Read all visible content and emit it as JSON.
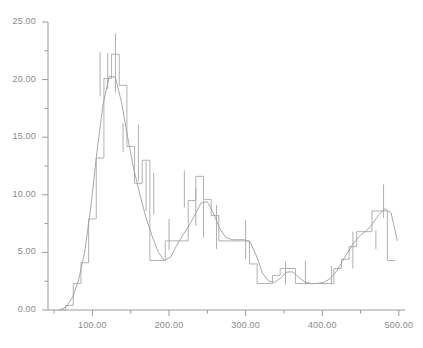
{
  "chart_data": {
    "type": "line",
    "title": "",
    "subtitle": "",
    "xlabel": "",
    "ylabel": "",
    "xlim": [
      42,
      508
    ],
    "ylim": [
      0,
      25
    ],
    "grid": false,
    "legend": null,
    "annotations": [],
    "x_ticks_major": [
      100,
      200,
      300,
      400,
      500
    ],
    "x_tick_labels": [
      "100.00",
      "200.00",
      "300.00",
      "400.00",
      "500.00"
    ],
    "x_ticks_minor": [
      50,
      150,
      250,
      350,
      450
    ],
    "y_ticks_major": [
      0,
      5,
      10,
      15,
      20,
      25
    ],
    "y_tick_labels": [
      "0.00",
      "5.00",
      "10.00",
      "15.00",
      "20.00",
      "25.00"
    ],
    "y_ticks_minor": [
      2.5,
      7.5,
      12.5,
      17.5,
      22.5
    ],
    "colors": {
      "step_line": "#a9a9a9",
      "smooth_line": "#9e9e9e",
      "error_bar": "#9a9a9a",
      "axis": "#9a9a9a",
      "tick_text": "#8a8a8a",
      "background": "#ffffff"
    },
    "series": [
      {
        "name": "binned-counts-step",
        "style": "step",
        "bin_edges": [
          55,
          65,
          75,
          85,
          95,
          105,
          115,
          125,
          135,
          145,
          155,
          165,
          175,
          185,
          195,
          205,
          215,
          225,
          235,
          245,
          255,
          265,
          275,
          285,
          295,
          305,
          315,
          325,
          335,
          345,
          355,
          365,
          375,
          385,
          395,
          405,
          415,
          425,
          435,
          445,
          455,
          465,
          475,
          485,
          495
        ],
        "bin_values": [
          0.0,
          0.4,
          2.3,
          4.1,
          7.9,
          13.2,
          20.1,
          22.2,
          19.5,
          14.2,
          11.0,
          13.0,
          4.3,
          4.3,
          6.0,
          6.0,
          6.0,
          9.5,
          11.6,
          9.6,
          8.2,
          6.0,
          6.0,
          6.0,
          6.0,
          4.0,
          2.3,
          2.3,
          3.0,
          3.6,
          3.6,
          2.3,
          2.3,
          2.3,
          2.3,
          2.3,
          3.6,
          4.4,
          5.5,
          6.8,
          6.8,
          8.6,
          8.6,
          4.3
        ]
      },
      {
        "name": "smooth-fit-curve",
        "style": "line",
        "x": [
          58,
          66,
          74,
          82,
          90,
          98,
          106,
          114,
          122,
          130,
          138,
          146,
          154,
          162,
          170,
          178,
          186,
          194,
          202,
          210,
          218,
          226,
          234,
          242,
          250,
          258,
          266,
          274,
          282,
          290,
          298,
          306,
          314,
          322,
          330,
          338,
          346,
          354,
          362,
          370,
          378,
          386,
          394,
          402,
          410,
          418,
          426,
          434,
          442,
          450,
          458,
          466,
          474,
          482,
          490,
          498
        ],
        "y": [
          0.0,
          0.3,
          1.1,
          2.6,
          5.1,
          9.0,
          13.8,
          17.9,
          20.3,
          20.2,
          18.0,
          15.0,
          12.2,
          10.0,
          8.0,
          6.4,
          5.0,
          4.3,
          4.6,
          5.6,
          6.5,
          7.3,
          8.3,
          9.3,
          9.4,
          8.4,
          7.1,
          6.3,
          6.1,
          6.1,
          6.1,
          5.9,
          4.7,
          3.2,
          2.5,
          2.4,
          2.8,
          3.3,
          3.3,
          2.8,
          2.4,
          2.3,
          2.3,
          2.4,
          2.7,
          3.3,
          4.2,
          5.1,
          5.9,
          6.5,
          6.9,
          7.5,
          8.3,
          8.8,
          8.4,
          6.0
        ]
      }
    ],
    "error_bars": [
      {
        "x": 110,
        "value": 20.1,
        "low": 18.6,
        "high": 22.4
      },
      {
        "x": 120,
        "value": 22.2,
        "low": 19.2,
        "high": 22.3
      },
      {
        "x": 130,
        "value": 19.5,
        "low": 18.9,
        "high": 24.0
      },
      {
        "x": 140,
        "value": 14.2,
        "low": 13.7,
        "high": 16.2
      },
      {
        "x": 160,
        "value": 13.0,
        "low": 11.2,
        "high": 16.1
      },
      {
        "x": 170,
        "value": 4.3,
        "low": 8.6,
        "high": 12.9
      },
      {
        "x": 180,
        "value": 4.3,
        "low": 8.3,
        "high": 11.9
      },
      {
        "x": 200,
        "value": 6.0,
        "low": 5.2,
        "high": 7.9
      },
      {
        "x": 220,
        "value": 9.5,
        "low": 8.9,
        "high": 12.1
      },
      {
        "x": 235,
        "value": 11.6,
        "low": 7.3,
        "high": 10.6
      },
      {
        "x": 245,
        "value": 9.6,
        "low": 6.3,
        "high": 9.5
      },
      {
        "x": 262,
        "value": 6.0,
        "low": 5.3,
        "high": 9.1
      },
      {
        "x": 300,
        "value": 6.0,
        "low": 4.4,
        "high": 7.8
      },
      {
        "x": 352,
        "value": 3.0,
        "low": 2.2,
        "high": 4.2
      },
      {
        "x": 378,
        "value": 2.3,
        "low": 2.2,
        "high": 4.3
      },
      {
        "x": 412,
        "value": 2.3,
        "low": 2.2,
        "high": 3.8
      },
      {
        "x": 440,
        "value": 4.4,
        "low": 3.6,
        "high": 6.8
      },
      {
        "x": 470,
        "value": 6.8,
        "low": 5.3,
        "high": 6.9
      },
      {
        "x": 480,
        "value": 8.6,
        "low": 8.0,
        "high": 10.9
      }
    ]
  }
}
